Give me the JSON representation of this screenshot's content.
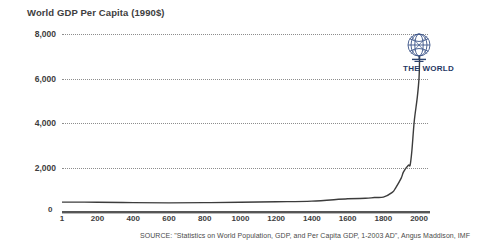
{
  "chart_data": {
    "type": "line",
    "title": "World GDP Per Capita (1990$)",
    "xlabel": "",
    "ylabel": "",
    "xlim": [
      1,
      2050
    ],
    "ylim": [
      0,
      8000
    ],
    "grid": true,
    "legend": "none",
    "ytick_labels": [
      "8,000",
      "6,000",
      "4,000",
      "2,000",
      "0"
    ],
    "ytick_values": [
      8000,
      6000,
      4000,
      2000,
      0
    ],
    "xtick_labels": [
      "1",
      "200",
      "400",
      "600",
      "800",
      "1000",
      "1200",
      "1400",
      "1600",
      "1800",
      "2000"
    ],
    "xtick_values": [
      1,
      200,
      400,
      600,
      800,
      1000,
      1200,
      1400,
      1600,
      1800,
      2000
    ],
    "series": [
      {
        "name": "World GDP Per Capita (1990$)",
        "color": "#3c3c3c",
        "x": [
          1,
          200,
          400,
          600,
          800,
          1000,
          1200,
          1400,
          1600,
          1700,
          1750,
          1800,
          1850,
          1870,
          1900,
          1913,
          1940,
          1950,
          1960,
          1973,
          1990,
          2000,
          2003
        ],
        "values": [
          445,
          440,
          420,
          410,
          420,
          435,
          460,
          490,
          595,
          615,
          650,
          670,
          880,
          1100,
          1525,
          1800,
          2100,
          2110,
          2775,
          4080,
          5150,
          6050,
          7000
        ]
      }
    ],
    "annotations": [
      {
        "name": "world-logo",
        "text": "THE WORLD",
        "icon": "globe-icon",
        "color": "#1f3864"
      }
    ],
    "source": "SOURCE: \"Statistics on World Population, GDP, and Per Capita GDP, 1-2003 AD\", Angus Maddison, IMF"
  },
  "colors": {
    "background": "#ffffff",
    "curve": "#3c3c3c",
    "grid": "#8d8d8d",
    "axis": "#565656",
    "text": "#3d3d3d",
    "brand": "#1f3864"
  }
}
